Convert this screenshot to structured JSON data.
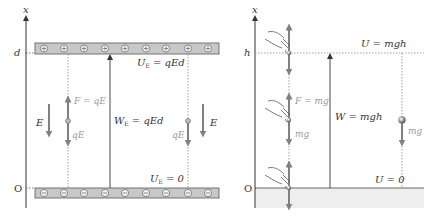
{
  "left_panel": {
    "title": "Electric field between charged plates",
    "axis_label": "x",
    "top_label": "d",
    "origin_label": "O",
    "top_plate_symbol": "⊕",
    "bottom_plate_symbol": "⊖",
    "plate_charge_count": 9,
    "potential_top": "U",
    "potential_top_sub": "E",
    "potential_top_value": " = qEd",
    "potential_bottom": "U",
    "potential_bottom_sub": "E",
    "potential_bottom_value": " = 0",
    "work": "W",
    "work_sub": "E",
    "work_value": " = qEd",
    "field_left": "E",
    "field_right": "E",
    "force_up": "F = qE",
    "force_down_left": "qE",
    "force_down_right": "qE"
  },
  "right_panel": {
    "title": "Gravitational field near ground",
    "axis_label": "x",
    "top_label": "h",
    "origin_label": "O",
    "potential_top": "U = mgh",
    "potential_bottom": "U = 0",
    "work": "W = mgh",
    "force_up": "F = mg",
    "force_down_left": "mg",
    "force_down_right": "mg"
  },
  "colors": {
    "line": "#333333",
    "arrow_gray": "#808080",
    "label_gray": "#9a9a9a",
    "plate_fill": "#c8c8c8",
    "plate_stroke": "#555555",
    "ground_fill": "#eeeeee",
    "dotted": "#888888"
  }
}
